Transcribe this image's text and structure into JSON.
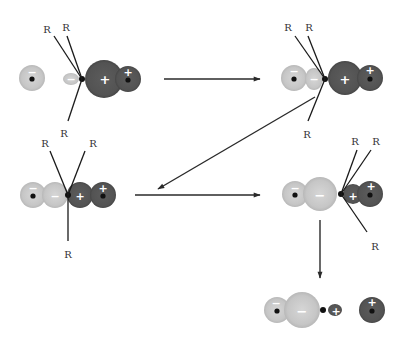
{
  "colors": {
    "background": "#ffffff",
    "negative_lobe": "#c8c8c8",
    "negative_lobe_edge": "#b4b4b4",
    "positive_lobe": "#555555",
    "positive_lobe_edge": "#474747",
    "nucleus": "#111111",
    "bond_line": "#1a1a1a",
    "arrow": "#2a2a2a",
    "label": "#333333"
  },
  "substituent_label": "R",
  "stages": [
    {
      "id": "reactants",
      "lobes": [
        {
          "cx": 32,
          "cy": 78,
          "r": 13,
          "type": "neg",
          "sign": "−",
          "sign_x": 32,
          "sign_y": 72,
          "nucleus": true
        },
        {
          "cx": 71,
          "cy": 79,
          "rx": 8,
          "ry": 6,
          "type": "neg",
          "sign": "−",
          "sign_x": 71,
          "sign_y": 79
        },
        {
          "cx": 104,
          "cy": 79,
          "r": 19,
          "type": "pos",
          "sign": "+",
          "sign_x": 105,
          "sign_y": 79
        },
        {
          "cx": 128,
          "cy": 79,
          "r": 13,
          "type": "pos",
          "sign": "+",
          "sign_x": 128,
          "sign_y": 72,
          "nucleus": true
        }
      ],
      "center": {
        "x": 82,
        "y": 79
      },
      "bonds": [
        {
          "x2": 54,
          "y2": 36,
          "label": "R",
          "lx": 47,
          "ly": 29
        },
        {
          "x2": 67,
          "y2": 36,
          "label": "R",
          "lx": 66,
          "ly": 27
        },
        {
          "x2": 68,
          "y2": 121,
          "label": "R",
          "lx": 64,
          "ly": 133
        }
      ]
    },
    {
      "id": "transition-approach",
      "lobes": [
        {
          "cx": 294,
          "cy": 78,
          "r": 13,
          "type": "neg",
          "sign": "−",
          "sign_x": 294,
          "sign_y": 71,
          "nucleus": true
        },
        {
          "cx": 314,
          "cy": 79,
          "rx": 9,
          "ry": 11,
          "type": "neg",
          "sign": "−",
          "sign_x": 314,
          "sign_y": 79
        },
        {
          "cx": 345,
          "cy": 78,
          "r": 17,
          "type": "pos",
          "sign": "+",
          "sign_x": 345,
          "sign_y": 79
        },
        {
          "cx": 370,
          "cy": 78,
          "r": 13,
          "type": "pos",
          "sign": "+",
          "sign_x": 370,
          "sign_y": 70,
          "nucleus": true
        }
      ],
      "center": {
        "x": 325,
        "y": 79
      },
      "bonds": [
        {
          "x2": 295,
          "y2": 36,
          "label": "R",
          "lx": 288,
          "ly": 27
        },
        {
          "x2": 308,
          "y2": 36,
          "label": "R",
          "lx": 309,
          "ly": 27
        },
        {
          "x2": 308,
          "y2": 121,
          "label": "R",
          "lx": 307,
          "ly": 134
        }
      ]
    },
    {
      "id": "pentacoordinate",
      "lobes": [
        {
          "cx": 33,
          "cy": 195,
          "r": 13,
          "type": "neg",
          "sign": "−",
          "sign_x": 33,
          "sign_y": 188,
          "nucleus": true
        },
        {
          "cx": 55,
          "cy": 195,
          "r": 13,
          "type": "neg",
          "sign": "−",
          "sign_x": 55,
          "sign_y": 196
        },
        {
          "cx": 80,
          "cy": 195,
          "r": 13,
          "type": "pos",
          "sign": "+",
          "sign_x": 80,
          "sign_y": 196
        },
        {
          "cx": 103,
          "cy": 195,
          "r": 13,
          "type": "pos",
          "sign": "+",
          "sign_x": 103,
          "sign_y": 188,
          "nucleus": true
        }
      ],
      "center": {
        "x": 68,
        "y": 195
      },
      "bonds": [
        {
          "x2": 50,
          "y2": 151,
          "label": "R",
          "lx": 45,
          "ly": 143
        },
        {
          "x2": 85,
          "y2": 151,
          "label": "R",
          "lx": 93,
          "ly": 143
        },
        {
          "x2": 68,
          "y2": 241,
          "label": "R",
          "lx": 68,
          "ly": 254
        }
      ]
    },
    {
      "id": "transition-leaving",
      "lobes": [
        {
          "cx": 295,
          "cy": 194,
          "r": 13,
          "type": "neg",
          "sign": "−",
          "sign_x": 295,
          "sign_y": 188,
          "nucleus": true
        },
        {
          "cx": 320,
          "cy": 194,
          "r": 17,
          "type": "neg",
          "sign": "−",
          "sign_x": 320,
          "sign_y": 195
        },
        {
          "cx": 353,
          "cy": 194,
          "r": 10,
          "type": "pos",
          "sign": "+",
          "sign_x": 353,
          "sign_y": 196
        },
        {
          "cx": 370,
          "cy": 194,
          "r": 13,
          "type": "pos",
          "sign": "+",
          "sign_x": 371,
          "sign_y": 186,
          "nucleus": true
        }
      ],
      "center": {
        "x": 341,
        "y": 194
      },
      "bonds": [
        {
          "x2": 357,
          "y2": 150,
          "label": "R",
          "lx": 355,
          "ly": 141
        },
        {
          "x2": 371,
          "y2": 150,
          "label": "R",
          "lx": 376,
          "ly": 141
        },
        {
          "x2": 367,
          "y2": 232,
          "label": "R",
          "lx": 375,
          "ly": 246
        }
      ]
    },
    {
      "id": "products",
      "lobes": [
        {
          "cx": 277,
          "cy": 310,
          "r": 13,
          "type": "neg",
          "sign": "−",
          "sign_x": 276,
          "sign_y": 303,
          "nucleus": true
        },
        {
          "cx": 302,
          "cy": 310,
          "r": 18,
          "type": "neg",
          "sign": "−",
          "sign_x": 302,
          "sign_y": 311
        },
        {
          "cx": 335,
          "cy": 310,
          "rx": 7,
          "ry": 6,
          "type": "pos",
          "sign": "+",
          "sign_x": 336,
          "sign_y": 311
        },
        {
          "cx": 372,
          "cy": 310,
          "r": 13,
          "type": "pos",
          "sign": "+",
          "sign_x": 372,
          "sign_y": 302,
          "nucleus": true
        }
      ],
      "center": {
        "x": 323,
        "y": 310
      },
      "bonds": []
    }
  ],
  "arrows": [
    {
      "id": "reactants-to-approach",
      "x1": 164,
      "y1": 79,
      "x2": 260,
      "y2": 79
    },
    {
      "id": "approach-to-pentacoordinate",
      "x1": 315,
      "y1": 97,
      "x2": 158,
      "y2": 189
    },
    {
      "id": "pentacoordinate-to-leaving",
      "x1": 135,
      "y1": 195,
      "x2": 260,
      "y2": 195
    },
    {
      "id": "leaving-to-products",
      "x1": 320,
      "y1": 220,
      "x2": 320,
      "y2": 278
    }
  ]
}
